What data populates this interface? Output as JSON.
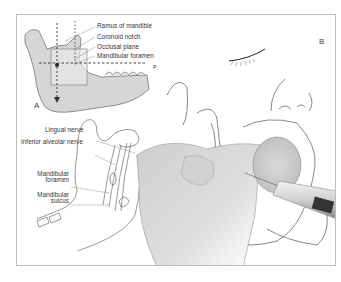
{
  "figure": {
    "panel_a": {
      "letter": "A",
      "labels": {
        "ramus": "Ramus of mandible",
        "coronoid": "Coronoid notch",
        "occlusal": "Occlusal plane",
        "foramen": "Mandibular foramen",
        "plane_marker": "P"
      }
    },
    "panel_inner": {
      "labels": {
        "lingual": "Lingual nerve",
        "inferior_alveolar": "Inferior alveolar nerve",
        "mand_foramen_1": "Mandibular",
        "mand_foramen_2": "foramen",
        "mand_sulcus_1": "Mandibular",
        "mand_sulcus_2": "sulcus"
      }
    },
    "panel_b": {
      "letter": "B"
    },
    "colors": {
      "frame": "#bdbdbd",
      "bone_fill": "#d6d6d6",
      "line": "#555555",
      "shade": "#bfbfbf"
    }
  }
}
